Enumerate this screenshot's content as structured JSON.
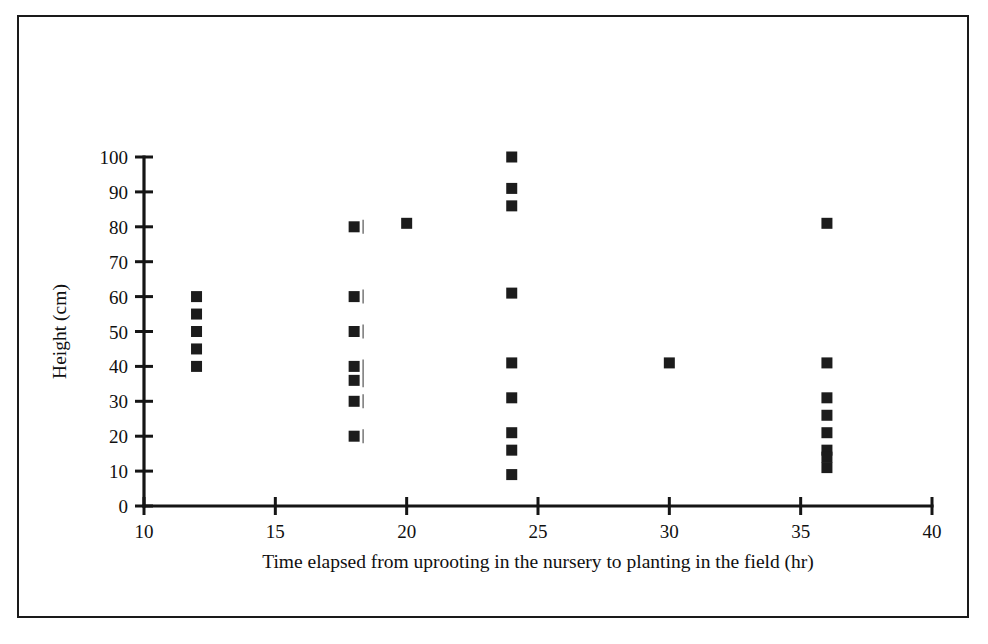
{
  "chart_data": {
    "type": "scatter",
    "title": "",
    "xlabel": "Time elapsed from uprooting in the nursery to planting in the field (hr)",
    "ylabel": "Height (cm)",
    "xlim": [
      10,
      40
    ],
    "ylim": [
      0,
      100
    ],
    "xticks": [
      10,
      15,
      20,
      25,
      30,
      35,
      40
    ],
    "yticks": [
      0,
      10,
      20,
      30,
      40,
      50,
      60,
      70,
      80,
      90,
      100
    ],
    "xtick_labels": [
      "10",
      "15",
      "20",
      "25",
      "30",
      "35",
      "40"
    ],
    "ytick_labels": [
      "0",
      "10",
      "20",
      "30",
      "40",
      "50",
      "60",
      "70",
      "80",
      "90",
      "100"
    ],
    "grid": false,
    "legend": false,
    "marker": "filled-square",
    "marker_color": "#1c1c1c",
    "points": [
      {
        "x": 12,
        "y": 60
      },
      {
        "x": 12,
        "y": 55
      },
      {
        "x": 12,
        "y": 50
      },
      {
        "x": 12,
        "y": 45
      },
      {
        "x": 12,
        "y": 40
      },
      {
        "x": 18,
        "y": 80
      },
      {
        "x": 18,
        "y": 60
      },
      {
        "x": 18,
        "y": 50
      },
      {
        "x": 18,
        "y": 40
      },
      {
        "x": 18,
        "y": 36
      },
      {
        "x": 18,
        "y": 30
      },
      {
        "x": 18,
        "y": 20
      },
      {
        "x": 20,
        "y": 81
      },
      {
        "x": 24,
        "y": 100
      },
      {
        "x": 24,
        "y": 91
      },
      {
        "x": 24,
        "y": 86
      },
      {
        "x": 24,
        "y": 61
      },
      {
        "x": 24,
        "y": 41
      },
      {
        "x": 24,
        "y": 31
      },
      {
        "x": 24,
        "y": 21
      },
      {
        "x": 24,
        "y": 16
      },
      {
        "x": 24,
        "y": 9
      },
      {
        "x": 30,
        "y": 41
      },
      {
        "x": 36,
        "y": 81
      },
      {
        "x": 36,
        "y": 41
      },
      {
        "x": 36,
        "y": 31
      },
      {
        "x": 36,
        "y": 26
      },
      {
        "x": 36,
        "y": 21
      },
      {
        "x": 36,
        "y": 16
      },
      {
        "x": 36,
        "y": 14
      },
      {
        "x": 36,
        "y": 11
      }
    ],
    "artifact_strokes": [
      {
        "x": 18,
        "y": 80
      },
      {
        "x": 18,
        "y": 60
      },
      {
        "x": 18,
        "y": 50
      },
      {
        "x": 18,
        "y": 40
      },
      {
        "x": 18,
        "y": 36
      },
      {
        "x": 18,
        "y": 30
      },
      {
        "x": 18,
        "y": 20
      }
    ]
  },
  "figure": {
    "border_color": "#1a1a1a",
    "background": "#ffffff"
  }
}
